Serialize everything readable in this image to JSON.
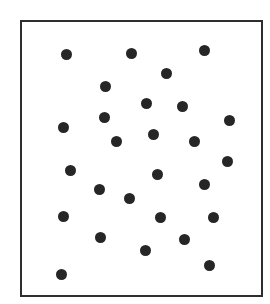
{
  "figure": {
    "frame": {
      "x": 20,
      "y": 20,
      "width": 243,
      "height": 277,
      "border_color": "#2e2e2e"
    },
    "dot_color": "#262626",
    "dot_count": 27,
    "dots": [
      {
        "x": 66,
        "y": 54
      },
      {
        "x": 131,
        "y": 53
      },
      {
        "x": 204,
        "y": 50
      },
      {
        "x": 166,
        "y": 73
      },
      {
        "x": 105,
        "y": 86
      },
      {
        "x": 146,
        "y": 103
      },
      {
        "x": 182,
        "y": 106
      },
      {
        "x": 104,
        "y": 117
      },
      {
        "x": 229,
        "y": 120
      },
      {
        "x": 63,
        "y": 127
      },
      {
        "x": 153,
        "y": 134
      },
      {
        "x": 116,
        "y": 141
      },
      {
        "x": 194,
        "y": 141
      },
      {
        "x": 227,
        "y": 161
      },
      {
        "x": 70,
        "y": 170
      },
      {
        "x": 157,
        "y": 174
      },
      {
        "x": 204,
        "y": 184
      },
      {
        "x": 99,
        "y": 189
      },
      {
        "x": 129,
        "y": 198
      },
      {
        "x": 63,
        "y": 216
      },
      {
        "x": 160,
        "y": 217
      },
      {
        "x": 213,
        "y": 217
      },
      {
        "x": 100,
        "y": 237
      },
      {
        "x": 184,
        "y": 239
      },
      {
        "x": 145,
        "y": 250
      },
      {
        "x": 209,
        "y": 265
      },
      {
        "x": 61,
        "y": 274
      }
    ]
  }
}
